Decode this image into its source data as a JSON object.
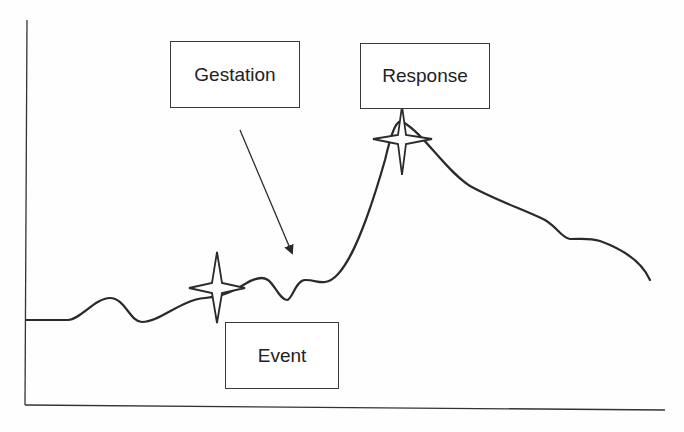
{
  "diagram": {
    "type": "event-response curve",
    "labels": {
      "gestation": "Gestation",
      "response": "Response",
      "event": "Event"
    },
    "markers": [
      {
        "name": "event-marker",
        "shape": "four-point-star"
      },
      {
        "name": "response-marker",
        "shape": "four-point-star"
      }
    ],
    "arrow": {
      "from": "Gestation",
      "points_to": "curve between Event and Response"
    },
    "axes": {
      "x_label": "",
      "y_label": "",
      "ticks": false
    },
    "colors": {
      "line": "#2a2a2a",
      "box_border": "#3a3a3a",
      "background": "#ffffff"
    }
  }
}
